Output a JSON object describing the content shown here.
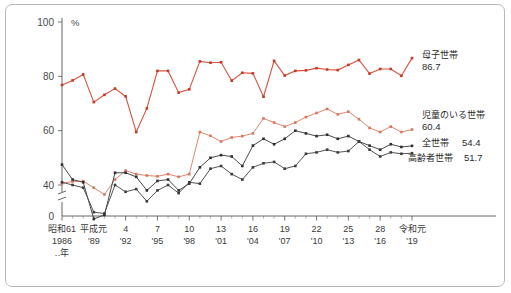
{
  "chart_data": {
    "type": "line",
    "title": "",
    "xlabel": "‥年",
    "ylabel": "%",
    "unit": "%",
    "ylim": [
      0,
      100
    ],
    "y_ticks": [
      "0",
      "40",
      "60",
      "80",
      "100"
    ],
    "y_axis_break": true,
    "grid": false,
    "legend_position": "right-end-of-line",
    "x_major_labels": [
      {
        "era": "昭和61",
        "year": "1986"
      },
      {
        "era": "平成元",
        "year": "'89"
      },
      {
        "era": "4",
        "year": "'92"
      },
      {
        "era": "7",
        "year": "'95"
      },
      {
        "era": "10",
        "year": "'98"
      },
      {
        "era": "13",
        "year": "'01"
      },
      {
        "era": "16",
        "year": "'04"
      },
      {
        "era": "19",
        "year": "'07"
      },
      {
        "era": "22",
        "year": "'10"
      },
      {
        "era": "25",
        "year": "'13"
      },
      {
        "era": "28",
        "year": "'16"
      },
      {
        "era": "令和元",
        "year": "'19"
      }
    ],
    "x": [
      1986,
      1987,
      1988,
      1989,
      1990,
      1991,
      1992,
      1993,
      1994,
      1995,
      1996,
      1997,
      1998,
      1999,
      2000,
      2001,
      2002,
      2003,
      2004,
      2005,
      2006,
      2007,
      2008,
      2009,
      2010,
      2011,
      2012,
      2013,
      2014,
      2015,
      2016,
      2017,
      2018,
      2019
    ],
    "series": [
      {
        "name": "母子世帯",
        "last_value": "86.7",
        "color": "#e2503c",
        "values": [
          76.8,
          78.5,
          80.7,
          70.5,
          73.2,
          75.5,
          72.6,
          59.5,
          68.2,
          82.0,
          82.0,
          74.0,
          75.2,
          85.5,
          85.0,
          85.2,
          78.4,
          81.3,
          81.1,
          72.5,
          85.7,
          80.3,
          82.0,
          82.2,
          83.0,
          82.5,
          82.3,
          84.2,
          86.0,
          81.0,
          82.7,
          82.7,
          80.2,
          86.7
        ]
      },
      {
        "name": "児童のいる世帯",
        "last_value": "60.4",
        "color": "#e2866f",
        "values": [
          40.6,
          41.3,
          41.4,
          39.0,
          36.5,
          42.0,
          45.3,
          44.0,
          43.5,
          43.2,
          44.0,
          43.0,
          44.0,
          59.5,
          58.1,
          56.0,
          57.5,
          58.0,
          59.0,
          64.5,
          63.0,
          61.5,
          63.0,
          65.0,
          66.5,
          68.0,
          66.0,
          67.0,
          64.2,
          61.0,
          59.5,
          61.5,
          59.5,
          60.4
        ]
      },
      {
        "name": "全世帯",
        "last_value": "54.4",
        "color": "#4a4a4a",
        "values": [
          47.5,
          42.0,
          41.0,
          27.5,
          29.0,
          44.5,
          44.5,
          43.0,
          38.0,
          41.5,
          42.0,
          38.0,
          40.5,
          46.5,
          50.0,
          51.0,
          50.5,
          47.0,
          54.5,
          57.0,
          55.0,
          57.0,
          60.0,
          59.0,
          58.0,
          58.5,
          57.0,
          58.0,
          56.0,
          54.5,
          53.0,
          55.0,
          54.0,
          54.4
        ]
      },
      {
        "name": "高齢者世帯",
        "last_value": "51.7",
        "color": "#555555",
        "values": [
          41.0,
          40.0,
          39.0,
          30.0,
          29.5,
          40.0,
          37.5,
          38.5,
          34.0,
          38.0,
          40.0,
          37.0,
          41.0,
          40.5,
          46.0,
          47.0,
          44.0,
          42.0,
          46.5,
          48.0,
          48.5,
          46.0,
          47.0,
          51.5,
          52.0,
          53.0,
          52.0,
          52.5,
          56.0,
          53.0,
          50.5,
          52.0,
          51.5,
          51.7
        ]
      }
    ]
  }
}
